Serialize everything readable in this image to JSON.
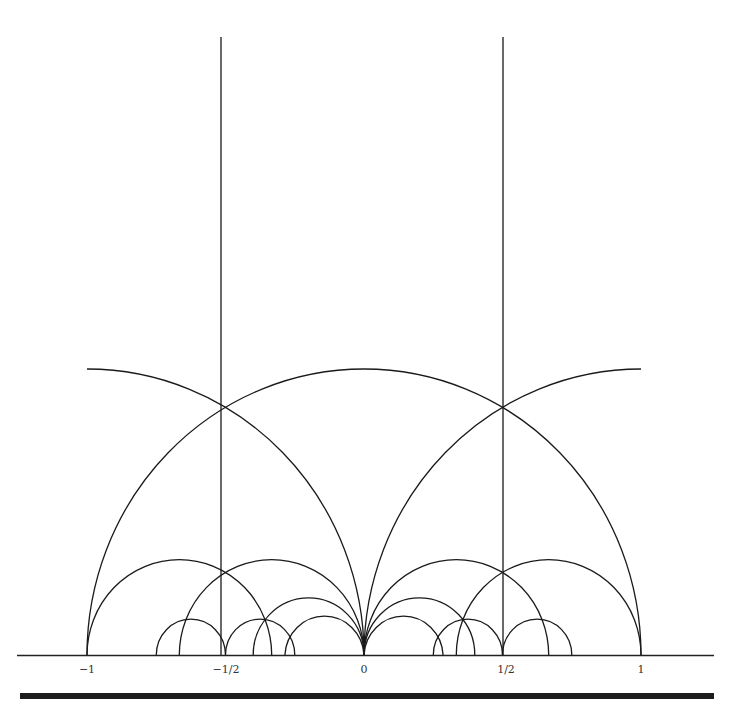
{
  "figure": {
    "colors": {
      "stroke": "#1a1a1a",
      "background": "#ffffff",
      "bar": "#1c1c1c"
    },
    "axis": {
      "tick_labels": [
        {
          "value": -1,
          "label": "−1"
        },
        {
          "value": -0.5,
          "label": "−1/2"
        },
        {
          "value": 0,
          "label": "0"
        },
        {
          "value": 0.5,
          "label": "1/2"
        },
        {
          "value": 1,
          "label": "1"
        }
      ]
    },
    "vertical_lines": [
      {
        "x": -0.5
      },
      {
        "x": 0.5
      }
    ],
    "semicircles": [
      {
        "center": 0,
        "radius": 1
      },
      {
        "center": -0.6667,
        "radius": 0.3333
      },
      {
        "center": -0.3333,
        "radius": 0.3333
      },
      {
        "center": -0.2,
        "radius": 0.2
      },
      {
        "center": -0.1429,
        "radius": 0.1429
      },
      {
        "center": -0.625,
        "radius": 0.125
      },
      {
        "center": -0.375,
        "radius": 0.125
      },
      {
        "center": 0.6667,
        "radius": 0.3333
      },
      {
        "center": 0.3333,
        "radius": 0.3333
      },
      {
        "center": 0.2,
        "radius": 0.2
      },
      {
        "center": 0.1429,
        "radius": 0.1429
      },
      {
        "center": 0.625,
        "radius": 0.125
      },
      {
        "center": 0.375,
        "radius": 0.125
      }
    ],
    "partial_arcs": [
      {
        "center": -1,
        "radius": 1,
        "from_x": -1,
        "to_x": 0
      },
      {
        "center": 1,
        "radius": 1,
        "from_x": 0,
        "to_x": 1
      }
    ]
  }
}
